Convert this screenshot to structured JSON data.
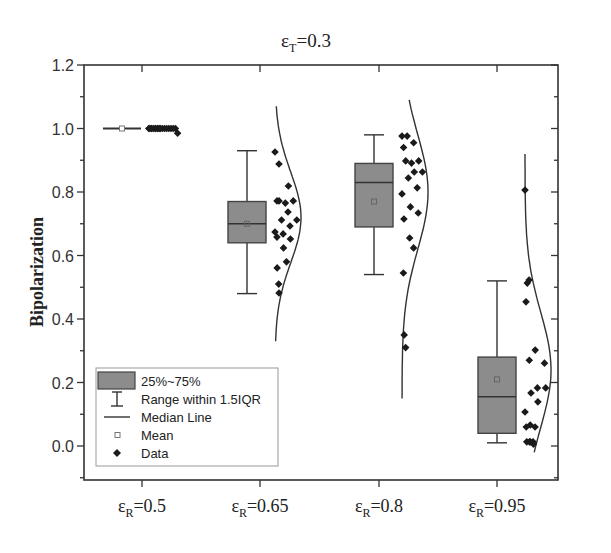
{
  "chart_data": {
    "type": "box",
    "title": "εT=0.3",
    "title_parts": {
      "base": "ε",
      "sub": "T",
      "rest": "=0.3"
    },
    "xlabel": "",
    "ylabel": "Bipolarization",
    "ylim": [
      -0.1,
      1.2
    ],
    "yticks": [
      0.0,
      0.2,
      0.4,
      0.6,
      0.8,
      1.0,
      1.2
    ],
    "ytick_labels": [
      "0.0",
      "0.2",
      "0.4",
      "0.6",
      "0.8",
      "1.0",
      "1.2"
    ],
    "categories": [
      "εR=0.5",
      "εR=0.65",
      "εR=0.8",
      "εR=0.95"
    ],
    "category_parts": [
      {
        "base": "ε",
        "sub": "R",
        "rest": "=0.5"
      },
      {
        "base": "ε",
        "sub": "R",
        "rest": "=0.65"
      },
      {
        "base": "ε",
        "sub": "R",
        "rest": "=0.8"
      },
      {
        "base": "ε",
        "sub": "R",
        "rest": "=0.95"
      }
    ],
    "grid": false,
    "legend_position": "lower-left",
    "colors": {
      "box_fill": "#8c8c8c",
      "line": "#333333",
      "point": "#1a1a1a"
    },
    "series": [
      {
        "name": "εR=0.5",
        "whisker_low": 1.0,
        "q1": 1.0,
        "median": 1.0,
        "q3": 1.0,
        "whisker_high": 1.0,
        "mean": 1.0,
        "points": [
          1.0,
          1.0,
          1.0,
          1.0,
          1.0,
          1.0,
          1.0,
          1.0,
          1.0,
          1.0,
          1.0,
          1.0,
          1.0,
          0.985,
          1.0,
          1.0,
          1.0,
          1.0,
          1.0,
          1.0
        ],
        "curve": null
      },
      {
        "name": "εR=0.65",
        "whisker_low": 0.48,
        "q1": 0.64,
        "median": 0.7,
        "q3": 0.77,
        "whisker_high": 0.93,
        "mean": 0.7,
        "points": [
          0.926,
          0.888,
          0.819,
          0.772,
          0.765,
          0.772,
          0.772,
          0.737,
          0.712,
          0.712,
          0.693,
          0.674,
          0.668,
          0.652,
          0.658,
          0.624,
          0.58,
          0.561,
          0.51,
          0.482
        ],
        "curve": {
          "top": 1.07,
          "bottom": 0.33,
          "peak": 0.72
        }
      },
      {
        "name": "εR=0.8",
        "whisker_low": 0.54,
        "q1": 0.69,
        "median": 0.83,
        "q3": 0.89,
        "whisker_high": 0.98,
        "mean": 0.77,
        "points": [
          0.976,
          0.976,
          0.955,
          0.94,
          0.891,
          0.898,
          0.898,
          0.863,
          0.863,
          0.844,
          0.813,
          0.794,
          0.753,
          0.734,
          0.715,
          0.655,
          0.624,
          0.545,
          0.35,
          0.31
        ],
        "curve": {
          "top": 1.09,
          "bottom": 0.15,
          "peak": 0.8
        }
      },
      {
        "name": "εR=0.95",
        "whisker_low": 0.01,
        "q1": 0.04,
        "median": 0.155,
        "q3": 0.28,
        "whisker_high": 0.52,
        "mean": 0.21,
        "points": [
          0.806,
          0.513,
          0.523,
          0.454,
          0.302,
          0.261,
          0.27,
          0.183,
          0.183,
          0.167,
          0.139,
          0.107,
          0.066,
          0.06,
          0.06,
          0.013,
          0.013,
          0.013,
          0.013,
          0.006
        ],
        "curve": {
          "top": 0.92,
          "bottom": -0.02,
          "peak": 0.24
        }
      }
    ]
  },
  "legend": {
    "items": [
      {
        "icon": "box-swatch",
        "label": "25%~75%"
      },
      {
        "icon": "whisker-icon",
        "label": "Range within 1.5IQR"
      },
      {
        "icon": "median-line-icon",
        "label": "Median Line"
      },
      {
        "icon": "mean-square-icon",
        "label": "Mean"
      },
      {
        "icon": "diamond-icon",
        "label": "Data"
      }
    ]
  }
}
